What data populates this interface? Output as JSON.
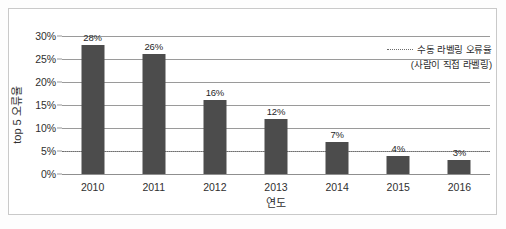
{
  "chart_data": {
    "type": "bar",
    "title": "",
    "categories": [
      "2010",
      "2011",
      "2012",
      "2013",
      "2014",
      "2015",
      "2016"
    ],
    "values": [
      28,
      26,
      16,
      12,
      7,
      4,
      3
    ],
    "data_labels": [
      "28%",
      "26%",
      "16%",
      "12%",
      "7%",
      "4%",
      "3%"
    ],
    "xlabel": "연도",
    "ylabel": "top 5 오류율",
    "ylim": [
      0,
      30
    ],
    "ytick_values": [
      0,
      5,
      10,
      15,
      20,
      25,
      30
    ],
    "ytick_labels": [
      "0%",
      "5%",
      "10%",
      "15%",
      "20%",
      "25%",
      "30%"
    ],
    "grid": true,
    "grid_axis": "y",
    "legend_position": "top-right",
    "bar_color": "#4c4c4c",
    "grid_color": "#9a9a9a",
    "reference_line": {
      "value": 5,
      "style": "dotted",
      "color": "#6f6f6f",
      "label": "수동 라벨링 오류율",
      "sublabel": "(사람이 직접 라벨링)"
    },
    "legend": [
      {
        "label": "수동 라벨링 오류율",
        "sublabel": "(사람이 직접 라벨링)",
        "marker": "dotted-line",
        "color": "#6a6a6a"
      }
    ]
  }
}
